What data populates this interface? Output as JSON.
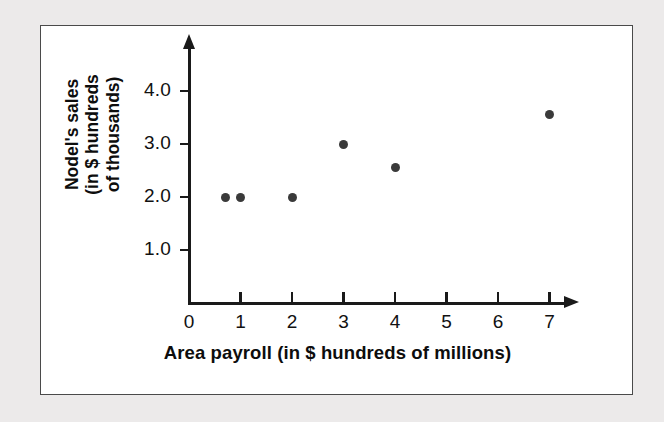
{
  "figure": {
    "background_color": "#eceaea",
    "card_color": "#ffffff",
    "border_color": "#4a4a4a",
    "point_color": "#3a3a3a",
    "axis_color": "#1a1a1a"
  },
  "chart_data": {
    "type": "scatter",
    "title": "",
    "xlabel": "Area payroll (in $ hundreds of millions)",
    "ylabel": "Nodel's sales (in $ hundreds of thousands)",
    "ylabel_lines": [
      "Nodel's sales",
      "(in $ hundreds",
      "of thousands)"
    ],
    "xlim": [
      0,
      7.6
    ],
    "ylim": [
      0,
      4.45
    ],
    "xticks": [
      0,
      1,
      2,
      3,
      4,
      5,
      6,
      7
    ],
    "xtick_labels": [
      "0",
      "1",
      "2",
      "3",
      "4",
      "5",
      "6",
      "7"
    ],
    "yticks": [
      1.0,
      2.0,
      3.0,
      4.0
    ],
    "ytick_labels": [
      "1.0",
      "2.0",
      "3.0",
      "4.0"
    ],
    "grid": false,
    "legend": null,
    "x_axis_arrow": true,
    "y_axis_arrow": true,
    "points": [
      {
        "x": 0.7,
        "y": 2.0
      },
      {
        "x": 1.0,
        "y": 2.0
      },
      {
        "x": 2.0,
        "y": 2.0
      },
      {
        "x": 3.0,
        "y": 3.0
      },
      {
        "x": 4.0,
        "y": 2.55
      },
      {
        "x": 7.0,
        "y": 3.55
      }
    ]
  }
}
